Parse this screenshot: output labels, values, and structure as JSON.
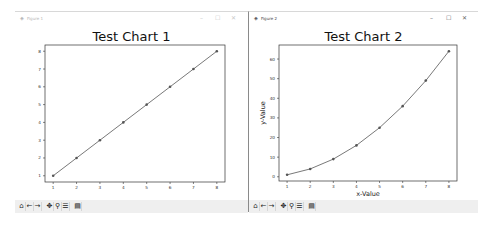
{
  "windows": [
    {
      "title": "Figure 1",
      "active": false,
      "controls": {
        "minimize": "–",
        "maximize": "☐",
        "close": "✕"
      },
      "toolbar": [
        {
          "name": "home-icon",
          "glyph": "⌂"
        },
        {
          "name": "back-arrow-icon",
          "glyph": "←"
        },
        {
          "name": "forward-arrow-icon",
          "glyph": "→"
        },
        {
          "name": "pan-icon",
          "glyph": "✥"
        },
        {
          "name": "zoom-icon",
          "glyph": "⚲"
        },
        {
          "name": "configure-subplots-icon",
          "glyph": "☰"
        },
        {
          "name": "save-icon",
          "glyph": "▤"
        }
      ]
    },
    {
      "title": "Figure 2",
      "active": true,
      "controls": {
        "minimize": "–",
        "maximize": "☐",
        "close": "✕"
      },
      "toolbar": [
        {
          "name": "home-icon",
          "glyph": "⌂"
        },
        {
          "name": "back-arrow-icon",
          "glyph": "←"
        },
        {
          "name": "forward-arrow-icon",
          "glyph": "→"
        },
        {
          "name": "pan-icon",
          "glyph": "✥"
        },
        {
          "name": "zoom-icon",
          "glyph": "⚲"
        },
        {
          "name": "configure-subplots-icon",
          "glyph": "☰"
        },
        {
          "name": "save-icon",
          "glyph": "▤"
        }
      ]
    }
  ],
  "chart_data": [
    {
      "type": "line",
      "title": "Test Chart 1",
      "xlabel": "",
      "ylabel": "",
      "x": [
        1,
        2,
        3,
        4,
        5,
        6,
        7,
        8
      ],
      "series": [
        {
          "name": "y",
          "values": [
            1,
            2,
            3,
            4,
            5,
            6,
            7,
            8
          ],
          "marker": "o"
        }
      ],
      "xticks": [
        1,
        2,
        3,
        4,
        5,
        6,
        7,
        8
      ],
      "yticks": [
        1,
        2,
        3,
        4,
        5,
        6,
        7,
        8
      ],
      "xlim": [
        0.65,
        8.35
      ],
      "ylim": [
        0.65,
        8.35
      ],
      "grid": false,
      "line_color": "#555555"
    },
    {
      "type": "line",
      "title": "Test Chart 2",
      "xlabel": "x-Value",
      "ylabel": "y-Value",
      "x": [
        1,
        2,
        3,
        4,
        5,
        6,
        7,
        8
      ],
      "series": [
        {
          "name": "y",
          "values": [
            1,
            4,
            9,
            16,
            25,
            36,
            49,
            64
          ],
          "marker": "o"
        }
      ],
      "xticks": [
        1,
        2,
        3,
        4,
        5,
        6,
        7,
        8
      ],
      "yticks": [
        0,
        10,
        20,
        30,
        40,
        50,
        60
      ],
      "xlim": [
        0.65,
        8.35
      ],
      "ylim": [
        -2.15,
        67.15
      ],
      "grid": false,
      "line_color": "#555555"
    }
  ]
}
